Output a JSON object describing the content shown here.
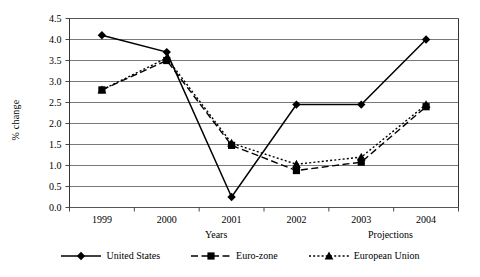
{
  "chart_data": {
    "type": "line",
    "title": "",
    "xlabel": "Years",
    "ylabel": "% change",
    "categories": [
      "1999",
      "2000",
      "2001",
      "2002",
      "2003",
      "2004"
    ],
    "ylim": [
      0.0,
      4.5
    ],
    "yticks": [
      "0.0",
      "0.5",
      "1.0",
      "1.5",
      "2.0",
      "2.5",
      "3.0",
      "3.5",
      "4.0",
      "4.5"
    ],
    "ytick_values": [
      0.0,
      0.5,
      1.0,
      1.5,
      2.0,
      2.5,
      3.0,
      3.5,
      4.0,
      4.5
    ],
    "grid": true,
    "legend_position": "bottom",
    "annotation": "Projections",
    "series": [
      {
        "name": "United States",
        "marker": "diamond",
        "line_style": "solid",
        "color": "#000000",
        "values": [
          4.1,
          3.7,
          0.25,
          2.45,
          2.45,
          4.0
        ]
      },
      {
        "name": "Euro-zone",
        "marker": "square",
        "line_style": "dashed",
        "color": "#000000",
        "values": [
          2.8,
          3.5,
          1.48,
          0.88,
          1.08,
          2.4
        ]
      },
      {
        "name": "European Union",
        "marker": "triangle",
        "line_style": "dotted",
        "color": "#000000",
        "values": [
          2.8,
          3.56,
          1.53,
          1.03,
          1.2,
          2.45
        ]
      }
    ]
  },
  "axis": {
    "y_title": "% change",
    "x_title": "Years",
    "projections_label": "Projections"
  },
  "legend": {
    "items": [
      {
        "label": "United States",
        "marker": "diamond-marker",
        "style": "solid"
      },
      {
        "label": "Euro-zone",
        "marker": "square-marker",
        "style": "dashed"
      },
      {
        "label": "European Union",
        "marker": "triangle-marker",
        "style": "dotted"
      }
    ]
  }
}
